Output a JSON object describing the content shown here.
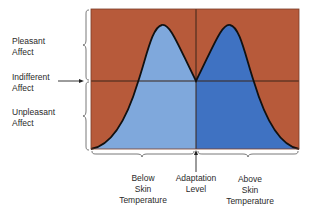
{
  "diagram": {
    "y_labels": {
      "pleasant": [
        "Pleasant",
        "Affect"
      ],
      "indifferent": [
        "Indifferent",
        "Affect"
      ],
      "unpleasant": [
        "Unpleasant",
        "Affect"
      ]
    },
    "x_labels": {
      "below": [
        "Below",
        "Skin",
        "Temperature"
      ],
      "adaptation": [
        "Adaptation",
        "Level"
      ],
      "above": [
        "Above",
        "Skin",
        "Temperature"
      ]
    },
    "colors": {
      "background": "#b75a3a",
      "below_fill": "#7fa8dc",
      "above_fill": "#3f72c2",
      "curve": "#111111",
      "bracket": "#555555"
    }
  }
}
